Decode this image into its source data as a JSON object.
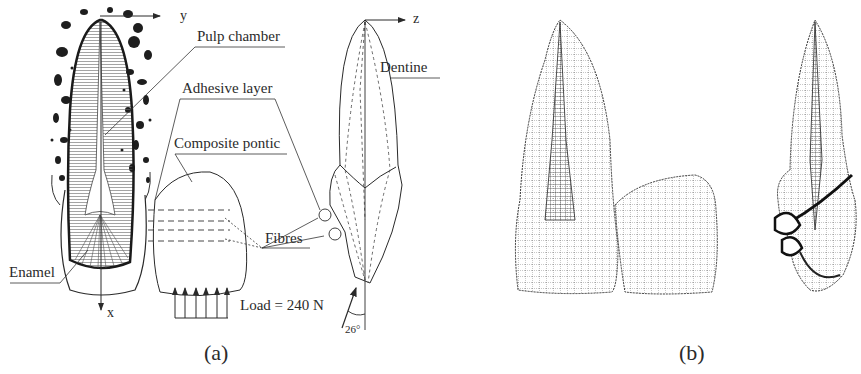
{
  "figure": {
    "panel_a": {
      "caption": "(a)",
      "labels": {
        "pulp_chamber": "Pulp chamber",
        "adhesive_layer": "Adhesive layer",
        "composite_pontic": "Composite pontic",
        "dentine": "Dentine",
        "fibres": "Fibres",
        "enamel": "Enamel",
        "load": "Load = 240 N",
        "angle": "26°"
      },
      "axes": {
        "y": "y",
        "x": "x",
        "z": "z"
      },
      "load_arrow_count": 6
    },
    "panel_b": {
      "caption": "(b)",
      "description": "Finite element wireframe mesh of tooth with composite pontic (front and side views)"
    }
  }
}
